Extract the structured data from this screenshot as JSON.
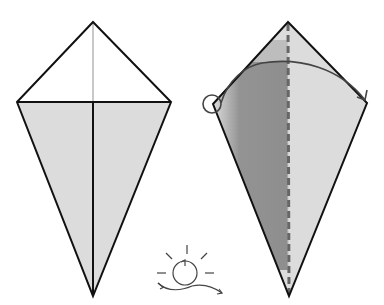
{
  "diagram": {
    "colors": {
      "background": "#ffffff",
      "paper_fill": "#dcdcdc",
      "outline": "#111111",
      "shadow": "#8a8a8a",
      "arrow": "#444444",
      "valley_line": "#666666"
    },
    "steps": [
      {
        "id": "step-1",
        "description": "Kite base with horizontal fold line and center crease",
        "points": {
          "top": [
            93,
            22
          ],
          "left": [
            17,
            102
          ],
          "right": [
            171,
            102
          ],
          "bottom": [
            93,
            296
          ]
        }
      },
      {
        "id": "step-2",
        "description": "Fold the left half over to the right along the dashed valley line",
        "points": {
          "top": [
            288,
            22
          ],
          "left": [
            213,
            104
          ],
          "right": [
            367,
            103
          ],
          "bottom": [
            289,
            296
          ]
        },
        "annotations": [
          "valley-fold-line",
          "fold-arrow",
          "start-point-circle"
        ]
      }
    ],
    "symbols": [
      {
        "id": "turn-over-symbol",
        "meaning": "Turn the model over",
        "center": [
          184,
          272
        ]
      }
    ]
  }
}
